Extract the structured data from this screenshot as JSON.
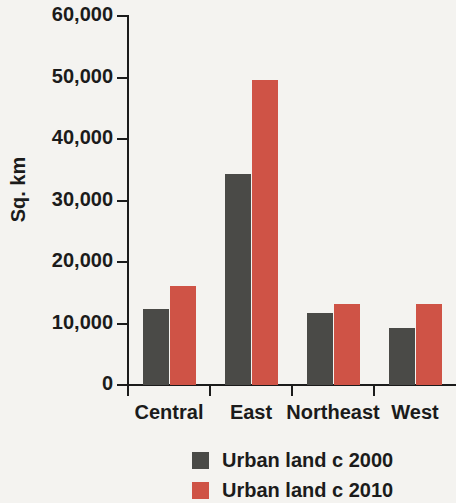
{
  "chart_data": {
    "type": "bar",
    "title": "",
    "subtitle": "",
    "xlabel": "",
    "ylabel": "Sq. km",
    "categories": [
      "Central",
      "East",
      "Northeast",
      "West"
    ],
    "series": [
      {
        "name": "Urban land c 2000",
        "color": "#4a4a47",
        "values": [
          12400,
          34300,
          11700,
          9200
        ]
      },
      {
        "name": "Urban land c 2010",
        "color": "#cf5346",
        "values": [
          16100,
          49600,
          13200,
          13100
        ]
      }
    ],
    "ylim": [
      0,
      60000
    ],
    "y_ticks": [
      0,
      10000,
      20000,
      30000,
      40000,
      50000,
      60000
    ],
    "y_tick_labels": [
      "0",
      "10,000",
      "20,000",
      "30,000",
      "40,000",
      "50,000",
      "60,000"
    ],
    "grid": false,
    "legend_position": "bottom-center",
    "background_color": "#f4f3f0",
    "axis_color": "#1b1b1b"
  },
  "legend": {
    "entries": [
      {
        "label": "Urban land c 2000",
        "color": "#4a4a47"
      },
      {
        "label": "Urban land c 2010",
        "color": "#cf5346"
      }
    ]
  }
}
